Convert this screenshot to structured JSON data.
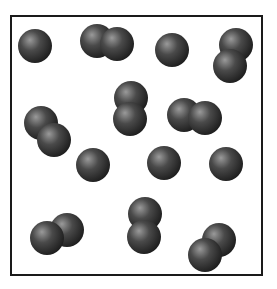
{
  "diagram": {
    "container": {
      "x": 11,
      "y": 16,
      "width": 251,
      "height": 259,
      "stroke": "#1a1a1a",
      "stroke_width": 2
    },
    "atom_radius": 17,
    "atom_color_light": "#9a9a9a",
    "atom_color_mid": "#4a4a4a",
    "atom_color_dark": "#1e1e1e",
    "counts": {
      "single_atoms": 6,
      "diatomic_molecules": 8,
      "total_atoms": 22
    },
    "particles": [
      {
        "type": "atom",
        "atoms": [
          [
            35,
            46
          ]
        ]
      },
      {
        "type": "diatomic",
        "atoms": [
          [
            97,
            41
          ],
          [
            117,
            44
          ]
        ]
      },
      {
        "type": "atom",
        "atoms": [
          [
            172,
            50
          ]
        ]
      },
      {
        "type": "diatomic",
        "atoms": [
          [
            236,
            45
          ],
          [
            230,
            66
          ]
        ]
      },
      {
        "type": "diatomic",
        "atoms": [
          [
            131,
            98
          ],
          [
            130,
            119
          ]
        ]
      },
      {
        "type": "diatomic",
        "atoms": [
          [
            184,
            115
          ],
          [
            205,
            118
          ]
        ]
      },
      {
        "type": "diatomic",
        "atoms": [
          [
            41,
            123
          ],
          [
            54,
            140
          ]
        ]
      },
      {
        "type": "atom",
        "atoms": [
          [
            93,
            165
          ]
        ]
      },
      {
        "type": "atom",
        "atoms": [
          [
            164,
            163
          ]
        ]
      },
      {
        "type": "atom",
        "atoms": [
          [
            226,
            164
          ]
        ]
      },
      {
        "type": "diatomic",
        "atoms": [
          [
            67,
            230
          ],
          [
            47,
            238
          ]
        ]
      },
      {
        "type": "diatomic",
        "atoms": [
          [
            145,
            214
          ],
          [
            144,
            237
          ]
        ]
      },
      {
        "type": "diatomic",
        "atoms": [
          [
            219,
            240
          ],
          [
            205,
            255
          ]
        ]
      }
    ]
  }
}
